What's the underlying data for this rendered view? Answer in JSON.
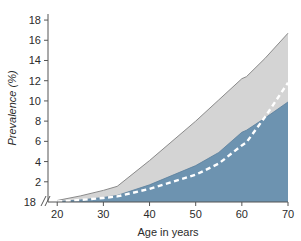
{
  "chart_data": {
    "type": "area",
    "title": "",
    "subtitle": "",
    "xlabel": "Age in years",
    "ylabel": "Prevalence (%)",
    "xlim": [
      18,
      70
    ],
    "ylim": [
      0,
      18.6
    ],
    "xticks": [
      20,
      30,
      40,
      50,
      60,
      70
    ],
    "xtick_labels": [
      "20",
      "30",
      "40",
      "50",
      "60",
      "70"
    ],
    "yticks": [
      2,
      4,
      6,
      8,
      10,
      12,
      14,
      16,
      18
    ],
    "ytick_labels": [
      "2",
      "4",
      "6",
      "8",
      "10",
      "12",
      "14",
      "16",
      "18"
    ],
    "y_origin_label": "18",
    "axis_break_symbol": "//",
    "grid": false,
    "legend": "none",
    "x": [
      20,
      25,
      30,
      33,
      40,
      50,
      55,
      60,
      61,
      65,
      70
    ],
    "series": [
      {
        "name": "Upper bound",
        "role": "upper-confidence-band",
        "fill_color": "#d4d4d4",
        "line_color": "#8a8a8a",
        "values": [
          0.15,
          0.6,
          1.15,
          1.55,
          4.1,
          8.0,
          10.1,
          12.2,
          12.4,
          14.2,
          16.7
        ]
      },
      {
        "name": "Lower bound",
        "role": "lower-confidence-band",
        "fill_color": "#6d93b0",
        "line_color": "#5b7f9c",
        "values": [
          0.05,
          0.2,
          0.45,
          0.65,
          1.7,
          3.6,
          4.9,
          6.9,
          7.1,
          8.3,
          9.9
        ]
      },
      {
        "name": "Central estimate",
        "role": "dashed-central-line",
        "line_color": "#ffffff",
        "line_style": "dashed",
        "values": [
          0.05,
          0.2,
          0.4,
          0.55,
          1.3,
          2.7,
          3.8,
          5.6,
          5.9,
          8.4,
          11.8
        ]
      }
    ],
    "colors": {
      "blue_area": "#6d93b0",
      "gray_area": "#d4d4d4",
      "gray_outline": "#8a8a8a",
      "dashed_line": "#ffffff",
      "axis": "#555555",
      "text": "#2b2b2b",
      "background": "#ffffff"
    }
  }
}
